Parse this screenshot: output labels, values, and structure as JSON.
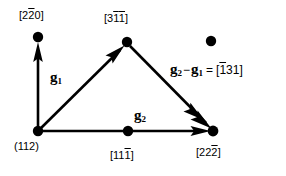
{
  "figure": {
    "type": "vector-diagram",
    "background_color": "#ffffff",
    "ink_color": "#000000"
  },
  "nodes": [
    {
      "id": "node-origin",
      "name": "origin-node",
      "x": 38,
      "y": 131,
      "radius": 5,
      "label": "(112)",
      "label_parts": [
        {
          "text": "(112)",
          "bar": false
        }
      ],
      "label_x": 14,
      "label_y": 141,
      "filled": true
    },
    {
      "id": "node-top-left",
      "name": "top-left-node",
      "x": 38,
      "y": 37,
      "radius": 5,
      "label": "[220]",
      "label_parts": [
        {
          "text": "[2",
          "bar": false
        },
        {
          "text": "2",
          "bar": true
        },
        {
          "text": "0]",
          "bar": false
        }
      ],
      "label_x": 19,
      "label_y": 10,
      "filled": true
    },
    {
      "id": "node-apex",
      "name": "apex-node",
      "x": 127,
      "y": 42,
      "radius": 5,
      "label": "[311]",
      "label_parts": [
        {
          "text": "[3",
          "bar": false
        },
        {
          "text": "1",
          "bar": true
        },
        {
          "text": "1",
          "bar": true
        },
        {
          "text": "]",
          "bar": false
        }
      ],
      "label_x": 104,
      "label_y": 13,
      "filled": true
    },
    {
      "id": "node-right",
      "name": "right-node",
      "x": 213,
      "y": 131,
      "radius": 5,
      "label": "[222]",
      "label_parts": [
        {
          "text": "[22",
          "bar": false
        },
        {
          "text": "2",
          "bar": true
        },
        {
          "text": "]",
          "bar": false
        }
      ],
      "label_x": 196,
      "label_y": 147,
      "filled": true
    },
    {
      "id": "node-midpoint",
      "name": "bottom-midpoint-node",
      "x": 128,
      "y": 131,
      "radius": 5,
      "label": "[111]",
      "label_parts": [
        {
          "text": "[11",
          "bar": false
        },
        {
          "text": "1",
          "bar": true
        },
        {
          "text": "]",
          "bar": false
        }
      ],
      "label_x": 110,
      "label_y": 150,
      "filled": true
    },
    {
      "id": "node-isolated",
      "name": "isolated-node",
      "x": 211,
      "y": 41,
      "radius": 5,
      "label": "",
      "label_parts": [],
      "filled": true
    }
  ],
  "vectors": [
    {
      "id": "vector-vertical",
      "name": "vertical-arrow",
      "from": {
        "x": 38,
        "y": 131
      },
      "to": {
        "x": 38,
        "y": 44
      },
      "label": ""
    },
    {
      "id": "vector-g1",
      "name": "g1-arrow",
      "from": {
        "x": 38,
        "y": 131
      },
      "to": {
        "x": 124,
        "y": 46
      },
      "label": "g1"
    },
    {
      "id": "vector-diagonal",
      "name": "diagonal-arrow",
      "from": {
        "x": 130,
        "y": 46
      },
      "to": {
        "x": 211,
        "y": 128
      },
      "label": ""
    },
    {
      "id": "vector-g2",
      "name": "g2-arrow",
      "from": {
        "x": 38,
        "y": 131
      },
      "to": {
        "x": 209,
        "y": 131
      },
      "label": "g2"
    }
  ],
  "vector_labels": [
    {
      "id": "label-g1",
      "name": "g1-label",
      "symbol": "g",
      "subscript": "1",
      "x": 50,
      "y": 70
    },
    {
      "id": "label-g2",
      "name": "g2-label",
      "symbol": "g",
      "subscript": "2",
      "x": 134,
      "y": 108
    }
  ],
  "equation": {
    "name": "vector-equation",
    "x": 170,
    "y": 62,
    "text": "g2-g1 = [131]",
    "lhs_symbol_1": "g",
    "lhs_sub_1": "2",
    "operator": "−",
    "lhs_symbol_2": "g",
    "lhs_sub_2": "1",
    "equals": "=",
    "rhs_parts": [
      {
        "text": "[",
        "bar": false
      },
      {
        "text": "1",
        "bar": true
      },
      {
        "text": "31]",
        "bar": false
      }
    ]
  }
}
